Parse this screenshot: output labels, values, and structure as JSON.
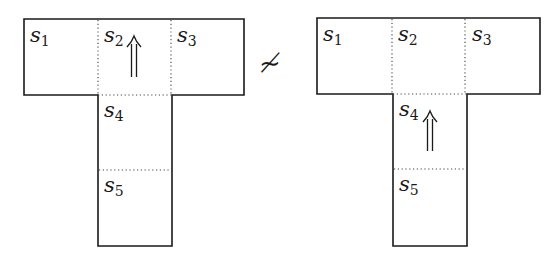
{
  "left_diagram": {
    "cells": [
      {
        "name": "s",
        "sub": "1"
      },
      {
        "name": "s",
        "sub": "2"
      },
      {
        "name": "s",
        "sub": "3"
      },
      {
        "name": "s",
        "sub": "4"
      },
      {
        "name": "s",
        "sub": "5"
      }
    ],
    "arrow_cell": "s2",
    "arrow_glyph": "⇑"
  },
  "relation": {
    "symbol": "≁"
  },
  "right_diagram": {
    "cells": [
      {
        "name": "s",
        "sub": "1"
      },
      {
        "name": "s",
        "sub": "2"
      },
      {
        "name": "s",
        "sub": "3"
      },
      {
        "name": "s",
        "sub": "4"
      },
      {
        "name": "s",
        "sub": "5"
      }
    ],
    "arrow_cell": "s4",
    "arrow_glyph": "⇑"
  },
  "colors": {
    "stroke": "#1a1a1a",
    "background": "#ffffff"
  }
}
